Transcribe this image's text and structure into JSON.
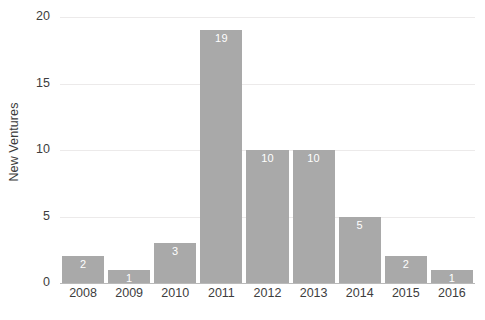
{
  "chart_data": {
    "type": "bar",
    "title": "",
    "subtitle": "",
    "xlabel": "",
    "ylabel": "New Ventures",
    "categories": [
      "2008",
      "2009",
      "2010",
      "2011",
      "2012",
      "2013",
      "2014",
      "2015",
      "2016"
    ],
    "values": [
      2,
      1,
      3,
      19,
      10,
      10,
      5,
      2,
      1
    ],
    "data_labels": [
      "2",
      "1",
      "3",
      "19",
      "10",
      "10",
      "5",
      "2",
      "1"
    ],
    "ylim": [
      0,
      20
    ],
    "yticks": [
      0,
      5,
      10,
      15,
      20
    ],
    "ytick_labels": [
      "0",
      "5",
      "10",
      "15",
      "20"
    ],
    "grid": "horizontal",
    "legend": "none",
    "bar_color": "#a9a9a9",
    "data_label_color": "#ffffff",
    "gridline_color": "#eceaea",
    "axis_text_color": "#3d3d3d",
    "background_color": "#ffffff"
  }
}
